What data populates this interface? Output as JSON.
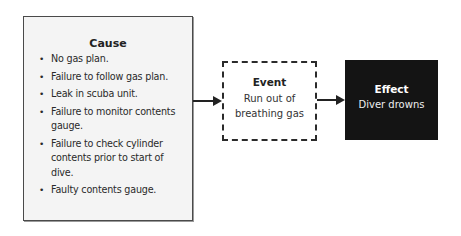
{
  "diagram": {
    "cause": {
      "title": "Cause",
      "items": [
        "No gas plan.",
        "Failure to follow gas plan.",
        "Leak in scuba unit.",
        "Failure to monitor contents gauge.",
        "Failure to check cylinder contents prior to start of dive.",
        "Faulty contents gauge."
      ]
    },
    "event": {
      "title": "Event",
      "text": "Run out of breathing gas"
    },
    "effect": {
      "title": "Effect",
      "text": "Diver drowns"
    },
    "bullet": "•",
    "colors": {
      "cause_fill": "#f4f4f4",
      "effect_fill": "#141414",
      "line": "#2b2b2b"
    }
  }
}
